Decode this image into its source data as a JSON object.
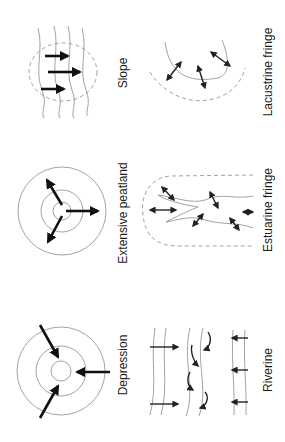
{
  "figure": {
    "panels": [
      {
        "id": "slope",
        "label": "Slope"
      },
      {
        "id": "extensive-peatland",
        "label": "Extensive peatland"
      },
      {
        "id": "depression",
        "label": "Depression"
      },
      {
        "id": "lacustrine-fringe",
        "label": "Lacustrine fringe"
      },
      {
        "id": "estuarine-fringe",
        "label": "Estuarine fringe"
      },
      {
        "id": "riverine",
        "label": "Riverine"
      }
    ],
    "orientation": "rotated 90 degrees counter-clockwise",
    "colors": {
      "line": "#8a8a8a",
      "arrow": "#111111",
      "text": "#1a1a1a",
      "background": "#ffffff"
    }
  }
}
